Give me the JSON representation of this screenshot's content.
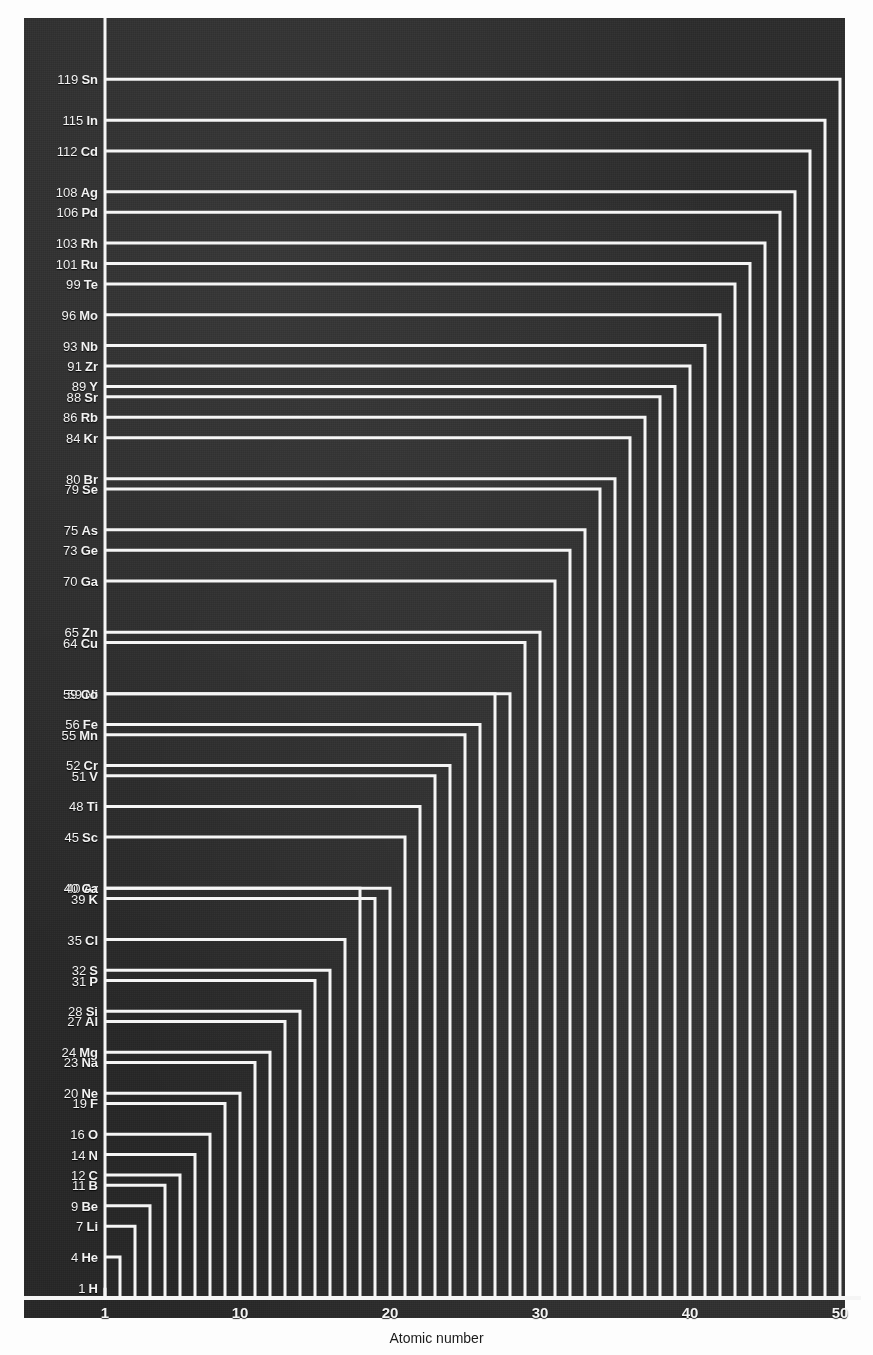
{
  "chart": {
    "type": "line",
    "title": "",
    "xlabel": "Atomic number",
    "ylabel": "",
    "xlim": [
      0.3,
      50.6
    ],
    "ylim": [
      0,
      124
    ],
    "grid": false,
    "legend": "none",
    "background_color": "#2e2e2e",
    "line_color": "#f5f5f5",
    "label_color": "#f2f2f2",
    "caption_color": "#1b1b1b",
    "x_ticks": [
      1,
      10,
      20,
      30,
      40,
      50
    ],
    "x_tick_labels": [
      "1",
      "10",
      "20",
      "30",
      "40",
      "50"
    ]
  },
  "chart_data": {
    "type": "line",
    "title": "",
    "xlabel": "Atomic number",
    "ylabel": "",
    "xlim": [
      0.3,
      50.6
    ],
    "ylim": [
      0,
      124
    ],
    "grid": false,
    "legend": "none",
    "x_ticks": [
      1,
      10,
      20,
      30,
      40,
      50
    ],
    "x_tick_labels": [
      "1",
      "10",
      "20",
      "30",
      "40",
      "50"
    ],
    "categories": [
      "H",
      "He",
      "Li",
      "Be",
      "B",
      "C",
      "N",
      "O",
      "F",
      "Ne",
      "Na",
      "Mg",
      "Al",
      "Si",
      "P",
      "S",
      "Cl",
      "Ar",
      "K",
      "Ca",
      "Sc",
      "Ti",
      "V",
      "Cr",
      "Mn",
      "Fe",
      "Ni",
      "Co",
      "Cu",
      "Zn",
      "Ga",
      "Ge",
      "As",
      "Se",
      "Br",
      "Kr",
      "Rb",
      "Sr",
      "Y",
      "Zr",
      "Nb",
      "Mo",
      "Te",
      "Ru",
      "Rh",
      "Pd",
      "Ag",
      "Cd",
      "In",
      "Sn"
    ],
    "x": [
      1,
      2,
      3,
      4,
      5,
      6,
      7,
      8,
      9,
      10,
      11,
      12,
      13,
      14,
      15,
      16,
      17,
      18,
      19,
      20,
      21,
      22,
      23,
      24,
      25,
      26,
      27,
      28,
      29,
      30,
      31,
      32,
      33,
      34,
      35,
      36,
      37,
      38,
      39,
      40,
      41,
      42,
      43,
      44,
      45,
      46,
      47,
      48,
      49,
      50
    ],
    "values": [
      1,
      4,
      7,
      9,
      11,
      12,
      14,
      16,
      19,
      20,
      23,
      24,
      27,
      28,
      31,
      32,
      35,
      40,
      39,
      40,
      45,
      48,
      51,
      52,
      55,
      56,
      59,
      59,
      64,
      65,
      70,
      73,
      75,
      79,
      80,
      84,
      86,
      88,
      89,
      91,
      93,
      96,
      99,
      101,
      103,
      106,
      108,
      112,
      115,
      119
    ],
    "series": [
      {
        "name": "Atomic mass",
        "points": [
          {
            "atomic_number": 1,
            "symbol": "H",
            "mass": 1,
            "label": "1 H"
          },
          {
            "atomic_number": 2,
            "symbol": "He",
            "mass": 4,
            "label": "4 He"
          },
          {
            "atomic_number": 3,
            "symbol": "Li",
            "mass": 7,
            "label": "7 Li"
          },
          {
            "atomic_number": 4,
            "symbol": "Be",
            "mass": 9,
            "label": "9 Be"
          },
          {
            "atomic_number": 5,
            "symbol": "B",
            "mass": 11,
            "label": "11 B"
          },
          {
            "atomic_number": 6,
            "symbol": "C",
            "mass": 12,
            "label": "12 C"
          },
          {
            "atomic_number": 7,
            "symbol": "N",
            "mass": 14,
            "label": "14 N"
          },
          {
            "atomic_number": 8,
            "symbol": "O",
            "mass": 16,
            "label": "16 O"
          },
          {
            "atomic_number": 9,
            "symbol": "F",
            "mass": 19,
            "label": "19 F"
          },
          {
            "atomic_number": 10,
            "symbol": "Ne",
            "mass": 20,
            "label": "20 Ne"
          },
          {
            "atomic_number": 11,
            "symbol": "Na",
            "mass": 23,
            "label": "23 Na"
          },
          {
            "atomic_number": 12,
            "symbol": "Mg",
            "mass": 24,
            "label": "24 Mg"
          },
          {
            "atomic_number": 13,
            "symbol": "Al",
            "mass": 27,
            "label": "27 Al"
          },
          {
            "atomic_number": 14,
            "symbol": "Si",
            "mass": 28,
            "label": "28 Si"
          },
          {
            "atomic_number": 15,
            "symbol": "P",
            "mass": 31,
            "label": "31 P"
          },
          {
            "atomic_number": 16,
            "symbol": "S",
            "mass": 32,
            "label": "32 S"
          },
          {
            "atomic_number": 17,
            "symbol": "Cl",
            "mass": 35,
            "label": "35 Cl"
          },
          {
            "atomic_number": 18,
            "symbol": "Ar",
            "mass": 40,
            "label": "40 Ar"
          },
          {
            "atomic_number": 19,
            "symbol": "K",
            "mass": 39,
            "label": "39 K"
          },
          {
            "atomic_number": 20,
            "symbol": "Ca",
            "mass": 40,
            "label": "40 Ca"
          },
          {
            "atomic_number": 21,
            "symbol": "Sc",
            "mass": 45,
            "label": "45 Sc"
          },
          {
            "atomic_number": 22,
            "symbol": "Ti",
            "mass": 48,
            "label": "48 Ti"
          },
          {
            "atomic_number": 23,
            "symbol": "V",
            "mass": 51,
            "label": "51 V"
          },
          {
            "atomic_number": 24,
            "symbol": "Cr",
            "mass": 52,
            "label": "52 Cr"
          },
          {
            "atomic_number": 25,
            "symbol": "Mn",
            "mass": 55,
            "label": "55 Mn"
          },
          {
            "atomic_number": 26,
            "symbol": "Fe",
            "mass": 56,
            "label": "56 Fe"
          },
          {
            "atomic_number": 27,
            "symbol": "Ni",
            "mass": 59,
            "label": "59 Ni"
          },
          {
            "atomic_number": 28,
            "symbol": "Co",
            "mass": 59,
            "label": "59 Co"
          },
          {
            "atomic_number": 29,
            "symbol": "Cu",
            "mass": 64,
            "label": "64 Cu"
          },
          {
            "atomic_number": 30,
            "symbol": "Zn",
            "mass": 65,
            "label": "65 Zn"
          },
          {
            "atomic_number": 31,
            "symbol": "Ga",
            "mass": 70,
            "label": "70 Ga"
          },
          {
            "atomic_number": 32,
            "symbol": "Ge",
            "mass": 73,
            "label": "73 Ge"
          },
          {
            "atomic_number": 33,
            "symbol": "As",
            "mass": 75,
            "label": "75 As"
          },
          {
            "atomic_number": 34,
            "symbol": "Se",
            "mass": 79,
            "label": "79 Se"
          },
          {
            "atomic_number": 35,
            "symbol": "Br",
            "mass": 80,
            "label": "80 Br"
          },
          {
            "atomic_number": 36,
            "symbol": "Kr",
            "mass": 84,
            "label": "84 Kr"
          },
          {
            "atomic_number": 37,
            "symbol": "Rb",
            "mass": 86,
            "label": "86 Rb"
          },
          {
            "atomic_number": 38,
            "symbol": "Sr",
            "mass": 88,
            "label": "88 Sr"
          },
          {
            "atomic_number": 39,
            "symbol": "Y",
            "mass": 89,
            "label": "89 Y"
          },
          {
            "atomic_number": 40,
            "symbol": "Zr",
            "mass": 91,
            "label": "91 Zr"
          },
          {
            "atomic_number": 41,
            "symbol": "Nb",
            "mass": 93,
            "label": "93 Nb"
          },
          {
            "atomic_number": 42,
            "symbol": "Mo",
            "mass": 96,
            "label": "96 Mo"
          },
          {
            "atomic_number": 43,
            "symbol": "Te",
            "mass": 99,
            "label": "99 Te"
          },
          {
            "atomic_number": 44,
            "symbol": "Ru",
            "mass": 101,
            "label": "101 Ru"
          },
          {
            "atomic_number": 45,
            "symbol": "Rh",
            "mass": 103,
            "label": "103 Rh"
          },
          {
            "atomic_number": 46,
            "symbol": "Pd",
            "mass": 106,
            "label": "106 Pd"
          },
          {
            "atomic_number": 47,
            "symbol": "Ag",
            "mass": 108,
            "label": "108 Ag"
          },
          {
            "atomic_number": 48,
            "symbol": "Cd",
            "mass": 112,
            "label": "112 Cd"
          },
          {
            "atomic_number": 49,
            "symbol": "In",
            "mass": 115,
            "label": "115 In"
          },
          {
            "atomic_number": 50,
            "symbol": "Sn",
            "mass": 119,
            "label": "119 Sn"
          }
        ]
      }
    ]
  }
}
